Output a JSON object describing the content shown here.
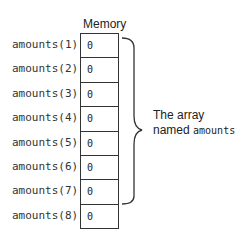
{
  "diagram": {
    "memory_label": "Memory",
    "rows": [
      {
        "label": "amounts(1)",
        "value": "0"
      },
      {
        "label": "amounts(2)",
        "value": "0"
      },
      {
        "label": "amounts(3)",
        "value": "0"
      },
      {
        "label": "amounts(4)",
        "value": "0"
      },
      {
        "label": "amounts(5)",
        "value": "0"
      },
      {
        "label": "amounts(6)",
        "value": "0"
      },
      {
        "label": "amounts(7)",
        "value": "0"
      },
      {
        "label": "amounts(8)",
        "value": "0"
      }
    ],
    "caption": {
      "line1": "The array",
      "line2_prefix": "named ",
      "line2_code": "amounts"
    }
  }
}
